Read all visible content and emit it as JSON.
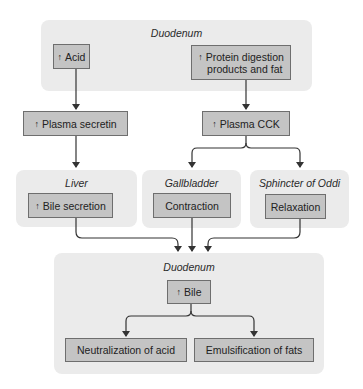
{
  "diagram": {
    "top_panel": {
      "label": "Duodenum",
      "acid": {
        "arrow": "↑",
        "text": "Acid"
      },
      "protein": {
        "arrow": "↑",
        "text_line1": "Protein digestion",
        "text_line2": "products and fat"
      }
    },
    "plasma_secretin": {
      "arrow": "↑",
      "text": "Plasma secretin"
    },
    "plasma_cck": {
      "arrow": "↑",
      "text": "Plasma CCK"
    },
    "liver_panel": {
      "label": "Liver",
      "box": {
        "arrow": "↑",
        "text": "Bile secretion"
      }
    },
    "gallbladder_panel": {
      "label": "Gallbladder",
      "box": {
        "text": "Contraction"
      }
    },
    "sphincter_panel": {
      "label": "Sphincter of Oddi",
      "box": {
        "text": "Relaxation"
      }
    },
    "bottom_panel": {
      "label": "Duodenum",
      "bile": {
        "arrow": "↑",
        "text": "Bile"
      },
      "neutralization": {
        "text": "Neutralization of acid"
      },
      "emulsification": {
        "text": "Emulsification of fats"
      }
    }
  },
  "colors": {
    "panel": "#ebebeb",
    "box": "#c4c4c4",
    "box_border": "#6e6e6e",
    "arrow": "#333333"
  }
}
